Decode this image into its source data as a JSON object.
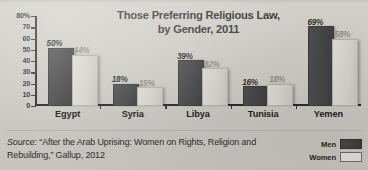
{
  "title": {
    "line1": "Those Preferring Religious Law,",
    "line2": "by Gender, 2011"
  },
  "source": {
    "prefix": "Source:",
    "line1": "“After the Arab Uprising: Women on Rights, Religion",
    "line2": "and Rebuilding,” Gallup, 2012"
  },
  "legend": {
    "men_label": "Men",
    "women_label": "Women"
  },
  "colors": {
    "men": "#464646",
    "women": "#d6d4cd",
    "background": "#cecbc4",
    "axis": "#2b2b2b",
    "title_text": "#3a3a3a"
  },
  "chart_data": {
    "type": "bar",
    "title": "Those Preferring Religious Law, by Gender, 2011",
    "xlabel": "",
    "ylabel": "",
    "ylim": [
      0,
      80
    ],
    "yticks": [
      0,
      10,
      20,
      30,
      40,
      50,
      60,
      70,
      80
    ],
    "ytick_labels": [
      "0",
      "10",
      "20",
      "30",
      "40",
      "50",
      "60",
      "70",
      "80%"
    ],
    "grid": false,
    "legend_position": "bottom-right",
    "categories": [
      "Egypt",
      "Syria",
      "Libya",
      "Tunisia",
      "Yemen"
    ],
    "series": [
      {
        "name": "Men",
        "color": "#464646",
        "values": [
          50,
          18,
          39,
          16,
          69
        ],
        "labels": [
          "50%",
          "18%",
          "39%",
          "16%",
          "69%"
        ]
      },
      {
        "name": "Women",
        "color": "#d6d4cd",
        "values": [
          44,
          15,
          32,
          18,
          58
        ],
        "labels": [
          "44%",
          "15%",
          "32%",
          "18%",
          "58%"
        ]
      }
    ]
  }
}
